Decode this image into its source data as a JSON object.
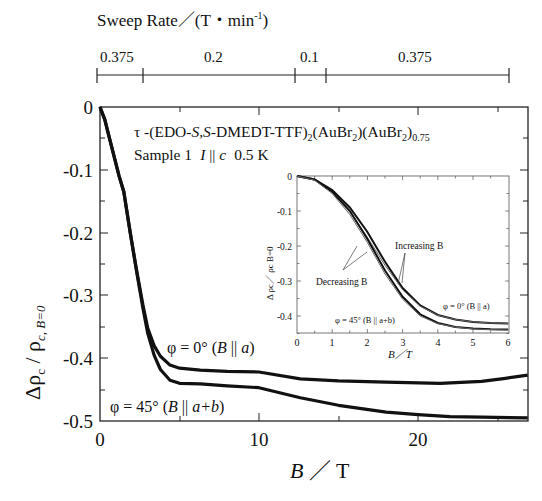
{
  "chart_data": {
    "type": "line",
    "title": "τ -(EDO-S,S-DMEDT-TTF)2(AuBr2)(AuBr2)0.75",
    "subtitle": "Sample 1  I || c  0.5 K",
    "xlabel": "B / T",
    "ylabel": "Δρc / ρc, B=0",
    "xlim": [
      0,
      26.9
    ],
    "ylim": [
      -0.5,
      0
    ],
    "x_ticks": [
      "0",
      "10",
      "20"
    ],
    "y_ticks": [
      "0",
      "-0.1",
      "-0.2",
      "-0.3",
      "-0.4",
      "-0.5"
    ],
    "grid": false,
    "top_axis": {
      "label": "Sweep Rate／(T・min-1)",
      "segments": [
        {
          "label": "0.375",
          "from": -0.2,
          "to": 2.7
        },
        {
          "label": "0.2",
          "from": 2.7,
          "to": 12.3
        },
        {
          "label": "0.1",
          "from": 12.3,
          "to": 14.2
        },
        {
          "label": "0.375",
          "from": 14.2,
          "to": 25.7
        }
      ]
    },
    "series": [
      {
        "name": "φ = 0° (B || a)",
        "x": [
          0,
          0.3,
          0.6,
          0.95,
          1.2,
          1.5,
          1.9,
          2.3,
          2.7,
          3.0,
          3.4,
          3.8,
          4.4,
          5.0,
          6.3,
          8,
          10,
          12.6,
          15,
          18,
          21.4,
          24,
          25.5,
          26.9
        ],
        "y": [
          0,
          -0.02,
          -0.05,
          -0.085,
          -0.11,
          -0.135,
          -0.2,
          -0.26,
          -0.315,
          -0.352,
          -0.38,
          -0.397,
          -0.411,
          -0.416,
          -0.419,
          -0.421,
          -0.422,
          -0.433,
          -0.436,
          -0.438,
          -0.44,
          -0.437,
          -0.432,
          -0.427
        ]
      },
      {
        "name": "φ = 45° (B || a+b)",
        "x": [
          0,
          0.3,
          0.6,
          0.95,
          1.2,
          1.5,
          1.9,
          2.3,
          2.7,
          3.0,
          3.4,
          3.8,
          4.4,
          5.0,
          6.3,
          8,
          10,
          12.6,
          15,
          18,
          20,
          22,
          24,
          26.9
        ],
        "y": [
          0,
          -0.02,
          -0.05,
          -0.085,
          -0.11,
          -0.135,
          -0.2,
          -0.262,
          -0.32,
          -0.36,
          -0.395,
          -0.418,
          -0.435,
          -0.44,
          -0.441,
          -0.444,
          -0.447,
          -0.463,
          -0.475,
          -0.486,
          -0.49,
          -0.493,
          -0.494,
          -0.495
        ]
      }
    ],
    "annotations": [
      "φ = 0° (B || a)",
      "φ = 45° (B || a+b)"
    ],
    "inset": {
      "xlabel": "B / T",
      "ylabel": "Δρc / ρc B=0",
      "xlim": [
        0,
        6
      ],
      "ylim": [
        -0.45,
        0
      ],
      "x_ticks": [
        "0",
        "1",
        "2",
        "3",
        "4",
        "5",
        "6"
      ],
      "y_ticks": [
        "0",
        "-0.1",
        "-0.2",
        "-0.3",
        "-0.4"
      ],
      "annotations": [
        "Increasing B",
        "Decreasing B",
        "φ = 0° (B || a)",
        "φ = 45° (B || a+b)"
      ],
      "series": [
        {
          "name": "φ = 0° increasing",
          "x": [
            0,
            0.5,
            1,
            1.5,
            2,
            2.5,
            3,
            3.5,
            4,
            4.5,
            5,
            5.5,
            6
          ],
          "y": [
            0,
            -0.01,
            -0.04,
            -0.09,
            -0.16,
            -0.245,
            -0.32,
            -0.37,
            -0.397,
            -0.41,
            -0.417,
            -0.42,
            -0.421
          ]
        },
        {
          "name": "φ = 0° decreasing",
          "x": [
            0,
            0.5,
            1,
            1.5,
            2,
            2.5,
            3,
            3.5,
            4,
            4.5,
            5,
            5.5,
            6
          ],
          "y": [
            0,
            -0.01,
            -0.045,
            -0.1,
            -0.175,
            -0.255,
            -0.325,
            -0.372,
            -0.398,
            -0.41,
            -0.417,
            -0.42,
            -0.421
          ]
        },
        {
          "name": "φ = 45° increasing",
          "x": [
            0,
            0.5,
            1,
            1.5,
            2,
            2.5,
            3,
            3.5,
            4,
            4.5,
            5,
            5.5,
            6
          ],
          "y": [
            0,
            -0.01,
            -0.045,
            -0.1,
            -0.18,
            -0.27,
            -0.345,
            -0.395,
            -0.42,
            -0.431,
            -0.436,
            -0.438,
            -0.439
          ]
        },
        {
          "name": "φ = 45° decreasing",
          "x": [
            0,
            0.5,
            1,
            1.5,
            2,
            2.5,
            3,
            3.5,
            4,
            4.5,
            5,
            5.5,
            6
          ],
          "y": [
            0,
            -0.012,
            -0.05,
            -0.11,
            -0.19,
            -0.28,
            -0.352,
            -0.4,
            -0.422,
            -0.432,
            -0.437,
            -0.439,
            -0.44
          ]
        }
      ]
    }
  },
  "labels": {
    "sweep_title": "Sweep Rate／(T・min",
    "sweep_exp": "-1",
    "sweep_close": ")",
    "seg1": "0.375",
    "seg2": "0.2",
    "seg3": "0.1",
    "seg4": "0.375",
    "title_main": "τ -(EDO-",
    "title_ss": "S,S",
    "title_rest": "-DMEDT-TTF)",
    "title_sub2": "2",
    "title_au": "(AuBr",
    "title_sub2b": "2",
    "title_au2": ")(AuBr",
    "title_sub2c": "2",
    "title_close": ")",
    "title_sub075": "0.75",
    "sample": "Sample 1",
    "sample_I": "I",
    "sample_par": " || ",
    "sample_c": "c",
    "sample_temp": "0.5 K",
    "phi0": "φ = 0°  (",
    "phi0_B": "B",
    "phi0_par": " || ",
    "phi0_a": "a",
    "phi0_close": ")",
    "phi45": "φ = 45°  (",
    "phi45_B": "B",
    "phi45_par": " || ",
    "phi45_ab": "a+b",
    "phi45_close": ")",
    "xlabel_B": "B",
    "xlabel_unit": " ／ T",
    "ylabel_delta": "Δρ",
    "ylabel_c": "c",
    "ylabel_slash": " / ρ",
    "ylabel_sub": "c, B=0",
    "xtick0": "0",
    "xtick10": "10",
    "xtick20": "20",
    "ytick0": "0",
    "ytick1": "-0.1",
    "ytick2": "-0.2",
    "ytick3": "-0.3",
    "ytick4": "-0.4",
    "ytick5": "-0.5",
    "inset_increasing": "Increasing B",
    "inset_decreasing": "Decreasing B",
    "inset_phi0": "φ = 0°  (B || a)",
    "inset_phi45": "φ = 45°  (B || a+b)",
    "inset_xlabel": "B／T",
    "inset_ylabel": "Δ ρc／ ρc B=0",
    "inset_x0": "0",
    "inset_x1": "1",
    "inset_x2": "2",
    "inset_x3": "3",
    "inset_x4": "4",
    "inset_x5": "5",
    "inset_x6": "6",
    "inset_y0": "0",
    "inset_y1": "-0.1",
    "inset_y2": "-0.2",
    "inset_y3": "-0.3",
    "inset_y4": "-0.4"
  }
}
